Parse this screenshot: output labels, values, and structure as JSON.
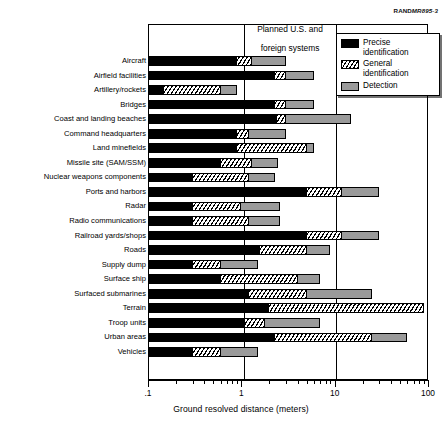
{
  "source_id": {
    "prefix": "RAND",
    "code": "MR895-3"
  },
  "header_band": {
    "line1": "Planned U.S. and",
    "line2": "foreign systems"
  },
  "legend": {
    "items": [
      {
        "label": "Precise identification",
        "key": "precise",
        "color": "#000000",
        "pattern": "solid-black"
      },
      {
        "label": "General identification",
        "key": "general",
        "color": "#ffffff",
        "pattern": "diagonal-hatch"
      },
      {
        "label": "Detection",
        "key": "detection",
        "color": "#9a9a9a",
        "pattern": "solid-gray"
      }
    ]
  },
  "axis": {
    "title": "Ground resolved distance (meters)",
    "tick_labels": [
      ".1",
      "1",
      "10",
      "100"
    ],
    "scale": "log10",
    "min": 0.1,
    "max": 100
  },
  "chart_data": {
    "type": "bar",
    "orientation": "horizontal",
    "stacked": true,
    "title": "",
    "xlabel": "Ground resolved distance (meters)",
    "ylabel": "",
    "xscale": "log",
    "xlim": [
      0.1,
      100
    ],
    "xticks": [
      0.1,
      1,
      10,
      100
    ],
    "xticklabels": [
      ".1",
      "1",
      "10",
      "100"
    ],
    "grid": "vertical at 1 and 10",
    "legend_position": "top-right",
    "annotations": [
      {
        "text": "Planned U.S. and foreign systems",
        "span": [
          1,
          10
        ],
        "position": "above-plot"
      }
    ],
    "series": [
      {
        "name": "Precise identification",
        "color": "#000000"
      },
      {
        "name": "General identification",
        "color": "#ffffff",
        "hatch": "///"
      },
      {
        "name": "Detection",
        "color": "#9a9a9a"
      }
    ],
    "categories": [
      "Aircraft",
      "Airfield facilities",
      "Artillery/rockets",
      "Bridges",
      "Coast and landing beaches",
      "Command headquarters",
      "Land minefields",
      "Missile site (SAM/SSM)",
      "Nuclear weapons components",
      "Ports and harbors",
      "Radar",
      "Radio communications",
      "Railroad yards/shops",
      "Roads",
      "Supply dump",
      "Surface ship",
      "Surfaced submarines",
      "Terrain",
      "Troop units",
      "Urban areas",
      "Vehicles"
    ],
    "rows": [
      {
        "category": "Aircraft",
        "precise_end": 0.9,
        "general_end": 1.3,
        "detection_end": 3.0
      },
      {
        "category": "Airfield facilities",
        "precise_end": 2.3,
        "general_end": 3.0,
        "detection_end": 6.0
      },
      {
        "category": "Artillery/rockets",
        "precise_end": 0.15,
        "general_end": 0.6,
        "detection_end": 0.9
      },
      {
        "category": "Bridges",
        "precise_end": 2.3,
        "general_end": 3.0,
        "detection_end": 6.0
      },
      {
        "category": "Coast and landing beaches",
        "precise_end": 2.4,
        "general_end": 3.0,
        "detection_end": 15.0
      },
      {
        "category": "Command headquarters",
        "precise_end": 0.9,
        "general_end": 1.2,
        "detection_end": 3.0
      },
      {
        "category": "Land minefields",
        "precise_end": 0.9,
        "general_end": 5.0,
        "detection_end": 6.0
      },
      {
        "category": "Missile site (SAM/SSM)",
        "precise_end": 0.6,
        "general_end": 1.3,
        "detection_end": 2.5
      },
      {
        "category": "Nuclear weapons components",
        "precise_end": 0.3,
        "general_end": 1.2,
        "detection_end": 2.3
      },
      {
        "category": "Ports and harbors",
        "precise_end": 5.0,
        "general_end": 12.0,
        "detection_end": 30.0
      },
      {
        "category": "Radar",
        "precise_end": 0.3,
        "general_end": 1.0,
        "detection_end": 2.6
      },
      {
        "category": "Radio communications",
        "precise_end": 0.3,
        "general_end": 1.2,
        "detection_end": 2.6
      },
      {
        "category": "Railroad yards/shops",
        "precise_end": 5.0,
        "general_end": 12.0,
        "detection_end": 30.0
      },
      {
        "category": "Roads",
        "precise_end": 1.6,
        "general_end": 5.0,
        "detection_end": 9.0
      },
      {
        "category": "Supply dump",
        "precise_end": 0.3,
        "general_end": 0.6,
        "detection_end": 1.5
      },
      {
        "category": "Surface ship",
        "precise_end": 0.6,
        "general_end": 4.0,
        "detection_end": 7.0
      },
      {
        "category": "Surfaced submarines",
        "precise_end": 1.2,
        "general_end": 5.0,
        "detection_end": 25.0
      },
      {
        "category": "Terrain",
        "precise_end": 2.0,
        "general_end": 90.0,
        "detection_end": 90.0
      },
      {
        "category": "Troop units",
        "precise_end": 1.1,
        "general_end": 1.8,
        "detection_end": 7.0
      },
      {
        "category": "Urban areas",
        "precise_end": 2.3,
        "general_end": 25.0,
        "detection_end": 60.0
      },
      {
        "category": "Vehicles",
        "precise_end": 0.3,
        "general_end": 0.6,
        "detection_end": 1.5
      }
    ]
  }
}
